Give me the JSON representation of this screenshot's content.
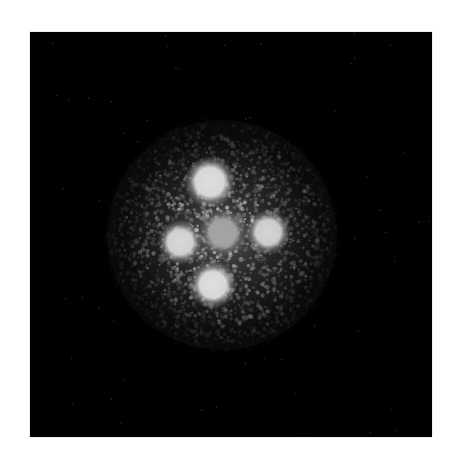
{
  "image": {
    "description": "Black-background astronomical image showing a cross-shaped arrangement of four bright point sources around a fainter central source, surrounded by a grainy diffuse glow",
    "background_color": "#000000",
    "page_color": "#ffffff",
    "frame": {
      "x": 30,
      "y": 32,
      "width": 402,
      "height": 405
    },
    "glow": {
      "cx": 192,
      "cy": 203,
      "radius": 115,
      "color": "#9a9a9a"
    },
    "sources": [
      {
        "name": "top-source",
        "cx": 180,
        "cy": 150,
        "r": 14,
        "brightness": 0.95
      },
      {
        "name": "left-source",
        "cx": 150,
        "cy": 210,
        "r": 12,
        "brightness": 0.92
      },
      {
        "name": "center-source",
        "cx": 193,
        "cy": 201,
        "r": 13,
        "brightness": 0.7
      },
      {
        "name": "right-source",
        "cx": 238,
        "cy": 200,
        "r": 12,
        "brightness": 0.9
      },
      {
        "name": "bottom-source",
        "cx": 183,
        "cy": 253,
        "r": 13,
        "brightness": 0.95
      }
    ]
  }
}
